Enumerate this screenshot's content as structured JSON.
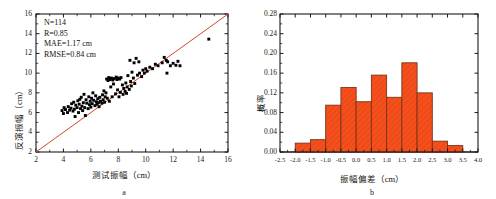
{
  "figure": {
    "panels": [
      {
        "caption": "a",
        "chart_data": {
          "type": "scatter",
          "title": "",
          "xlabel": "测试振幅（cm）",
          "ylabel": "反演振幅（cm）",
          "xlim": [
            2,
            16
          ],
          "ylim": [
            2,
            16
          ],
          "xticks": [
            2,
            4,
            6,
            8,
            10,
            12,
            14,
            16
          ],
          "yticks": [
            2,
            4,
            6,
            8,
            10,
            12,
            14,
            16
          ],
          "xtick_labels": [
            "2",
            "4",
            "6",
            "8",
            "10",
            "12",
            "14",
            "16"
          ],
          "ytick_labels": [
            "2",
            "4",
            "6",
            "8",
            "10",
            "12",
            "14",
            "16"
          ],
          "grid": false,
          "legend": "none",
          "marker_color": "#000000",
          "marker_shape": "square",
          "reference_line": {
            "name": "1:1 line",
            "color": "#d2462f",
            "from": [
              2,
              2
            ],
            "to": [
              16,
              16
            ]
          },
          "annotations": [
            "N=114",
            "R=0.85",
            "MAE=1.17 cm",
            "RMSE=0.84 cm"
          ],
          "stats": {
            "N": 114,
            "R": 0.85,
            "MAE": "1.17 cm",
            "RMSE": "0.84 cm"
          },
          "points": [
            [
              3.9,
              6.2
            ],
            [
              4.0,
              5.9
            ],
            [
              4.05,
              6.5
            ],
            [
              4.15,
              6.3
            ],
            [
              4.3,
              6.0
            ],
            [
              4.35,
              6.6
            ],
            [
              4.45,
              6.25
            ],
            [
              4.55,
              6.45
            ],
            [
              4.6,
              6.9
            ],
            [
              4.7,
              6.15
            ],
            [
              4.75,
              7.05
            ],
            [
              4.8,
              6.35
            ],
            [
              4.85,
              5.6
            ],
            [
              4.9,
              6.75
            ],
            [
              5.0,
              6.5
            ],
            [
              5.05,
              7.2
            ],
            [
              5.1,
              6.0
            ],
            [
              5.15,
              6.85
            ],
            [
              5.2,
              7.35
            ],
            [
              5.25,
              6.4
            ],
            [
              5.3,
              7.55
            ],
            [
              5.35,
              6.65
            ],
            [
              5.4,
              6.2
            ],
            [
              5.45,
              7.0
            ],
            [
              5.5,
              7.85
            ],
            [
              5.55,
              6.5
            ],
            [
              5.6,
              5.7
            ],
            [
              5.65,
              7.3
            ],
            [
              5.7,
              6.95
            ],
            [
              5.8,
              6.4
            ],
            [
              5.85,
              7.6
            ],
            [
              5.9,
              6.8
            ],
            [
              5.95,
              7.15
            ],
            [
              6.0,
              6.55
            ],
            [
              6.05,
              7.45
            ],
            [
              6.1,
              6.9
            ],
            [
              6.15,
              8.0
            ],
            [
              6.2,
              7.25
            ],
            [
              6.3,
              6.7
            ],
            [
              6.35,
              7.7
            ],
            [
              6.4,
              7.1
            ],
            [
              6.45,
              6.85
            ],
            [
              6.5,
              7.4
            ],
            [
              6.55,
              7.0
            ],
            [
              6.6,
              6.6
            ],
            [
              6.65,
              7.55
            ],
            [
              6.7,
              7.15
            ],
            [
              6.8,
              6.95
            ],
            [
              6.85,
              7.8
            ],
            [
              6.9,
              7.3
            ],
            [
              6.95,
              8.2
            ],
            [
              7.0,
              7.05
            ],
            [
              7.05,
              7.6
            ],
            [
              7.1,
              8.0
            ],
            [
              7.15,
              9.4
            ],
            [
              7.2,
              7.45
            ],
            [
              7.25,
              9.25
            ],
            [
              7.3,
              9.55
            ],
            [
              7.35,
              7.15
            ],
            [
              7.4,
              9.35
            ],
            [
              7.45,
              8.6
            ],
            [
              7.5,
              9.5
            ],
            [
              7.55,
              7.6
            ],
            [
              7.6,
              9.3
            ],
            [
              7.65,
              8.9
            ],
            [
              7.7,
              9.45
            ],
            [
              7.8,
              7.9
            ],
            [
              7.85,
              9.6
            ],
            [
              7.9,
              9.35
            ],
            [
              7.95,
              8.3
            ],
            [
              8.0,
              9.5
            ],
            [
              8.05,
              7.6
            ],
            [
              8.1,
              9.4
            ],
            [
              8.15,
              8.05
            ],
            [
              8.2,
              9.55
            ],
            [
              8.3,
              8.8
            ],
            [
              8.35,
              7.85
            ],
            [
              8.4,
              8.45
            ],
            [
              8.5,
              8.15
            ],
            [
              8.55,
              9.0
            ],
            [
              8.6,
              7.95
            ],
            [
              8.65,
              8.6
            ],
            [
              8.7,
              9.75
            ],
            [
              8.8,
              8.35
            ],
            [
              8.85,
              11.3
            ],
            [
              8.9,
              9.15
            ],
            [
              8.95,
              8.7
            ],
            [
              9.0,
              10.1
            ],
            [
              9.1,
              9.5
            ],
            [
              9.15,
              11.05
            ],
            [
              9.2,
              8.95
            ],
            [
              9.3,
              11.5
            ],
            [
              9.4,
              9.8
            ],
            [
              9.5,
              11.15
            ],
            [
              9.55,
              10.0
            ],
            [
              9.7,
              9.65
            ],
            [
              9.8,
              10.3
            ],
            [
              9.9,
              10.0
            ],
            [
              10.0,
              10.45
            ],
            [
              10.1,
              10.2
            ],
            [
              10.3,
              10.6
            ],
            [
              10.5,
              10.45
            ],
            [
              10.7,
              10.9
            ],
            [
              10.9,
              10.75
            ],
            [
              11.2,
              11.05
            ],
            [
              11.35,
              11.6
            ],
            [
              11.5,
              11.3
            ],
            [
              11.55,
              10.0
            ],
            [
              11.6,
              11.15
            ],
            [
              11.8,
              10.75
            ],
            [
              12.0,
              11.0
            ],
            [
              12.2,
              10.8
            ],
            [
              12.35,
              11.2
            ],
            [
              12.5,
              10.75
            ],
            [
              14.6,
              13.45
            ]
          ]
        }
      },
      {
        "caption": "b",
        "chart_data": {
          "type": "bar",
          "title": "",
          "xlabel": "振幅偏差（cm）",
          "ylabel": "概率",
          "xlim": [
            -2.5,
            4.0
          ],
          "ylim": [
            0.0,
            0.28
          ],
          "xticks": [
            -2.5,
            -2.0,
            -1.5,
            -1.0,
            -0.5,
            0.0,
            0.5,
            1.0,
            1.5,
            2.0,
            2.5,
            3.0,
            3.5,
            4.0
          ],
          "yticks": [
            0.0,
            0.04,
            0.08,
            0.12,
            0.16,
            0.2,
            0.24,
            0.28
          ],
          "xtick_labels": [
            "-2.5",
            "-2.0",
            "-1.5",
            "-1.0",
            "-0.5",
            "0.0",
            "0.5",
            "1.0",
            "1.5",
            "2.0",
            "2.5",
            "3.0",
            "3.5",
            "4.0"
          ],
          "ytick_labels": [
            "0.00",
            "0.04",
            "0.08",
            "0.12",
            "0.16",
            "0.20",
            "0.24",
            "0.28"
          ],
          "grid": false,
          "legend": "none",
          "bar_fill": "#f4501e",
          "bar_edge": "#7a3417",
          "bin_width": 0.5,
          "bin_starts": [
            -2.0,
            -1.5,
            -1.0,
            -0.5,
            0.0,
            0.5,
            1.0,
            1.5,
            2.0,
            2.5,
            3.0
          ],
          "categories": [
            "-2.0~-1.5",
            "-1.5~-1.0",
            "-1.0~-0.5",
            "-0.5~0.0",
            "0.0~0.5",
            "0.5~1.0",
            "1.0~1.5",
            "1.5~2.0",
            "2.0~2.5",
            "2.5~3.0",
            "3.0~3.5"
          ],
          "values": [
            0.018,
            0.025,
            0.095,
            0.131,
            0.102,
            0.156,
            0.111,
            0.181,
            0.12,
            0.022,
            0.013
          ]
        }
      }
    ]
  }
}
